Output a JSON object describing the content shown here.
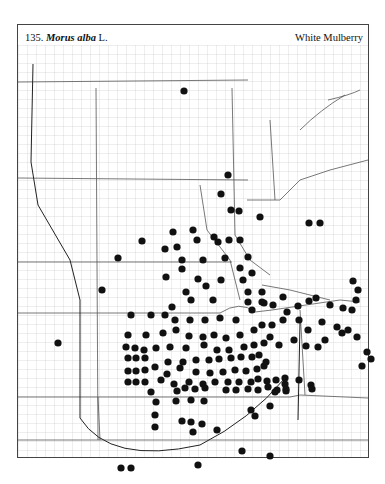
{
  "header": {
    "number": "135.",
    "genus_species": "Morus alba",
    "author": "L.",
    "common_name": "White Mulberry"
  },
  "map": {
    "dot_color": "#111111",
    "line_color": "#666666",
    "dots": [
      [
        184,
        91
      ],
      [
        228,
        175
      ],
      [
        221,
        194
      ],
      [
        231,
        210
      ],
      [
        239,
        211
      ],
      [
        260,
        217
      ],
      [
        309,
        223
      ],
      [
        320,
        223
      ],
      [
        173,
        232
      ],
      [
        193,
        230
      ],
      [
        177,
        247
      ],
      [
        197,
        240
      ],
      [
        214,
        237
      ],
      [
        218,
        242
      ],
      [
        229,
        240
      ],
      [
        240,
        240
      ],
      [
        142,
        241
      ],
      [
        165,
        249
      ],
      [
        118,
        258
      ],
      [
        182,
        260
      ],
      [
        203,
        260
      ],
      [
        225,
        258
      ],
      [
        240,
        268
      ],
      [
        221,
        280
      ],
      [
        248,
        257
      ],
      [
        243,
        280
      ],
      [
        252,
        273
      ],
      [
        102,
        290
      ],
      [
        248,
        292
      ],
      [
        248,
        302
      ],
      [
        262,
        292
      ],
      [
        262,
        302
      ],
      [
        166,
        277
      ],
      [
        182,
        269
      ],
      [
        198,
        279
      ],
      [
        186,
        292
      ],
      [
        206,
        286
      ],
      [
        172,
        307
      ],
      [
        191,
        300
      ],
      [
        213,
        300
      ],
      [
        131,
        315
      ],
      [
        151,
        315
      ],
      [
        165,
        315
      ],
      [
        175,
        320
      ],
      [
        190,
        320
      ],
      [
        205,
        320
      ],
      [
        220,
        318
      ],
      [
        236,
        320
      ],
      [
        252,
        310
      ],
      [
        264,
        303
      ],
      [
        273,
        305
      ],
      [
        283,
        297
      ],
      [
        287,
        312
      ],
      [
        298,
        306
      ],
      [
        309,
        301
      ],
      [
        316,
        298
      ],
      [
        128,
        335
      ],
      [
        146,
        335
      ],
      [
        163,
        333
      ],
      [
        176,
        330
      ],
      [
        189,
        336
      ],
      [
        203,
        337
      ],
      [
        214,
        335
      ],
      [
        226,
        338
      ],
      [
        240,
        335
      ],
      [
        254,
        330
      ],
      [
        262,
        325
      ],
      [
        272,
        325
      ],
      [
        283,
        320
      ],
      [
        299,
        320
      ],
      [
        308,
        330
      ],
      [
        322,
        322
      ],
      [
        330,
        305
      ],
      [
        343,
        308
      ],
      [
        352,
        310
      ],
      [
        358,
        290
      ],
      [
        356,
        300
      ],
      [
        353,
        281
      ],
      [
        337,
        327
      ],
      [
        342,
        333
      ],
      [
        348,
        330
      ],
      [
        357,
        337
      ],
      [
        367,
        352
      ],
      [
        371,
        359
      ],
      [
        362,
        366
      ],
      [
        58,
        343
      ],
      [
        126,
        347
      ],
      [
        135,
        348
      ],
      [
        144,
        350
      ],
      [
        156,
        348
      ],
      [
        170,
        347
      ],
      [
        186,
        348
      ],
      [
        204,
        345
      ],
      [
        217,
        350
      ],
      [
        229,
        350
      ],
      [
        244,
        347
      ],
      [
        254,
        345
      ],
      [
        264,
        343
      ],
      [
        270,
        337
      ],
      [
        279,
        345
      ],
      [
        294,
        340
      ],
      [
        306,
        346
      ],
      [
        318,
        347
      ],
      [
        325,
        340
      ],
      [
        128,
        358
      ],
      [
        136,
        358
      ],
      [
        145,
        358
      ],
      [
        155,
        367
      ],
      [
        168,
        362
      ],
      [
        183,
        362
      ],
      [
        196,
        360
      ],
      [
        209,
        360
      ],
      [
        219,
        359
      ],
      [
        231,
        358
      ],
      [
        241,
        357
      ],
      [
        252,
        357
      ],
      [
        259,
        355
      ],
      [
        266,
        362
      ],
      [
        128,
        371
      ],
      [
        136,
        371
      ],
      [
        145,
        370
      ],
      [
        167,
        374
      ],
      [
        180,
        368
      ],
      [
        196,
        372
      ],
      [
        210,
        373
      ],
      [
        223,
        372
      ],
      [
        235,
        370
      ],
      [
        246,
        371
      ],
      [
        257,
        369
      ],
      [
        264,
        366
      ],
      [
        128,
        382
      ],
      [
        136,
        382
      ],
      [
        145,
        382
      ],
      [
        161,
        380
      ],
      [
        174,
        384
      ],
      [
        189,
        382
      ],
      [
        203,
        384
      ],
      [
        215,
        382
      ],
      [
        228,
        382
      ],
      [
        239,
        382
      ],
      [
        251,
        382
      ],
      [
        258,
        379
      ],
      [
        267,
        381
      ],
      [
        276,
        380
      ],
      [
        285,
        384
      ],
      [
        299,
        380
      ],
      [
        311,
        385
      ],
      [
        151,
        392
      ],
      [
        177,
        391
      ],
      [
        185,
        388
      ],
      [
        195,
        389
      ],
      [
        205,
        388
      ],
      [
        226,
        390
      ],
      [
        236,
        390
      ],
      [
        248,
        389
      ],
      [
        258,
        390
      ],
      [
        268,
        387
      ],
      [
        277,
        390
      ],
      [
        286,
        391
      ],
      [
        312,
        389
      ],
      [
        176,
        401
      ],
      [
        191,
        400
      ],
      [
        156,
        402
      ],
      [
        275,
        392
      ],
      [
        286,
        389
      ],
      [
        191,
        422
      ],
      [
        155,
        415
      ],
      [
        155,
        427
      ],
      [
        182,
        421
      ],
      [
        202,
        424
      ],
      [
        193,
        432
      ],
      [
        217,
        430
      ],
      [
        251,
        410
      ],
      [
        255,
        416
      ],
      [
        242,
        451
      ],
      [
        270,
        456
      ],
      [
        198,
        465
      ],
      [
        121,
        468
      ],
      [
        131,
        468
      ],
      [
        285,
        378
      ],
      [
        270,
        406
      ],
      [
        204,
        401
      ]
    ],
    "bold_lines": [
      "M33,64 L31,162 L38,205 L70,260 L80,300 L80,418 Q110,465 200,445 Q250,420 285,378",
      "M300,322 L298,420"
    ]
  }
}
